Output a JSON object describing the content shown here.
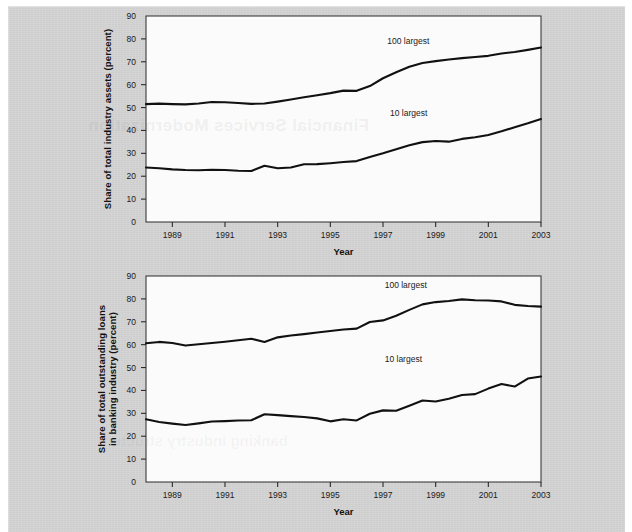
{
  "page": {
    "background_color": "#d2d2d2",
    "paper_color": "#fbfbfb",
    "line_color": "#111111"
  },
  "ghost_text": {
    "top": "Financial Services Modernization",
    "bottom": "banking industry structure"
  },
  "chart_data": [
    {
      "id": "industry-assets",
      "type": "line",
      "title": "",
      "xlabel": "Year",
      "ylabel": "Share of total industry assets (percent)",
      "xlim": [
        1988,
        2003
      ],
      "ylim": [
        0,
        90
      ],
      "ytick_values": [
        0,
        10,
        20,
        30,
        40,
        50,
        60,
        70,
        80,
        90
      ],
      "ytick_labels": [
        "0",
        "10",
        "20",
        "30",
        "40",
        "50",
        "60",
        "70",
        "80",
        "90"
      ],
      "xtick_values": [
        1989,
        1991,
        1993,
        1995,
        1997,
        1999,
        2001,
        2003
      ],
      "xtick_labels": [
        "1989",
        "1991",
        "1993",
        "1995",
        "1997",
        "1999",
        "2001",
        "2003"
      ],
      "grid": false,
      "legend_position": "inline-annotation",
      "x": [
        1988.0,
        1988.5,
        1989.0,
        1989.5,
        1990.0,
        1990.5,
        1991.0,
        1991.5,
        1992.0,
        1992.5,
        1993.0,
        1993.5,
        1994.0,
        1994.5,
        1995.0,
        1995.5,
        1996.0,
        1996.5,
        1997.0,
        1997.5,
        1998.0,
        1998.5,
        1999.0,
        1999.5,
        2000.0,
        2000.5,
        2001.0,
        2001.5,
        2002.0,
        2002.5,
        2003.0
      ],
      "series": [
        {
          "name": "100 largest",
          "label": "100 largest",
          "label_x": 1998.0,
          "label_y": 78.5,
          "values": [
            51.5,
            51.7,
            51.5,
            51.4,
            51.8,
            52.4,
            52.3,
            52.0,
            51.6,
            51.8,
            52.6,
            53.5,
            54.5,
            55.4,
            56.3,
            57.4,
            57.3,
            59.4,
            62.8,
            65.4,
            67.8,
            69.5,
            70.3,
            71.0,
            71.6,
            72.1,
            72.6,
            73.6,
            74.3,
            75.2,
            76.2
          ]
        },
        {
          "name": "10 largest",
          "label": "10 largest",
          "label_x": 1998.1,
          "label_y": 47.0,
          "values": [
            23.8,
            23.5,
            23.0,
            22.7,
            22.6,
            22.8,
            22.7,
            22.4,
            22.3,
            24.6,
            23.5,
            23.8,
            25.2,
            25.3,
            25.7,
            26.2,
            26.6,
            28.4,
            30.0,
            31.8,
            33.5,
            34.9,
            35.4,
            35.1,
            36.3,
            37.0,
            38.0,
            39.6,
            41.4,
            43.1,
            45.0
          ]
        }
      ]
    },
    {
      "id": "outstanding-loans",
      "type": "line",
      "title": "",
      "xlabel": "Year",
      "ylabel": "Share of total outstanding loans in banking industry (percent)",
      "ylabel_line1": "Share of total outstanding loans",
      "ylabel_line2": "in banking industry (percent)",
      "xlim": [
        1988,
        2003
      ],
      "ylim": [
        0,
        90
      ],
      "ytick_values": [
        0,
        10,
        20,
        30,
        40,
        50,
        60,
        70,
        80,
        90
      ],
      "ytick_labels": [
        "0",
        "10",
        "20",
        "30",
        "40",
        "50",
        "60",
        "70",
        "80",
        "90"
      ],
      "xtick_values": [
        1989,
        1991,
        1993,
        1995,
        1997,
        1999,
        2001,
        2003
      ],
      "xtick_labels": [
        "1989",
        "1991",
        "1993",
        "1995",
        "1997",
        "1999",
        "2001",
        "2003"
      ],
      "grid": false,
      "legend_position": "inline-annotation",
      "x": [
        1988.0,
        1988.5,
        1989.0,
        1989.5,
        1990.0,
        1990.5,
        1991.0,
        1991.5,
        1992.0,
        1992.5,
        1993.0,
        1993.5,
        1994.0,
        1994.5,
        1995.0,
        1995.5,
        1996.0,
        1996.5,
        1997.0,
        1997.5,
        1998.0,
        1998.5,
        1999.0,
        1999.5,
        2000.0,
        2000.5,
        2001.0,
        2001.5,
        2002.0,
        2002.5,
        2003.0
      ],
      "series": [
        {
          "name": "100 largest",
          "label": "100 largest",
          "label_x": 1997.9,
          "label_y": 85.5,
          "values": [
            60.6,
            61.2,
            60.7,
            59.6,
            60.2,
            60.7,
            61.3,
            61.9,
            62.6,
            61.2,
            63.2,
            64.0,
            64.6,
            65.3,
            66.0,
            66.6,
            67.0,
            69.9,
            70.6,
            72.6,
            75.2,
            77.6,
            78.6,
            79.1,
            79.8,
            79.4,
            79.3,
            78.9,
            77.4,
            76.9,
            76.6
          ]
        },
        {
          "name": "10 largest",
          "label": "10 largest",
          "label_x": 1997.9,
          "label_y": 53.5,
          "values": [
            27.4,
            26.2,
            25.5,
            24.9,
            25.6,
            26.4,
            26.6,
            26.9,
            27.0,
            29.6,
            29.2,
            28.8,
            28.4,
            27.8,
            26.5,
            27.4,
            26.9,
            29.8,
            31.3,
            31.1,
            33.3,
            35.6,
            35.2,
            36.4,
            38.0,
            38.4,
            40.8,
            42.8,
            41.7,
            45.2,
            46.1
          ]
        }
      ]
    }
  ]
}
